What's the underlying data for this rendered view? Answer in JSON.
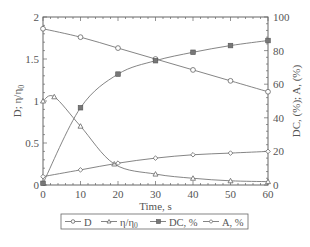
{
  "chart_data": {
    "type": "line",
    "title": "",
    "xlabel": "Time, s",
    "ylabel_left": "D; η/η0",
    "ylabel_right": "DC, (%); A, (%)",
    "xlim": [
      0,
      60
    ],
    "ylim_left": [
      0,
      2
    ],
    "ylim_right": [
      0,
      100
    ],
    "x_ticks": [
      0,
      10,
      20,
      30,
      40,
      50,
      60
    ],
    "y_ticks_left": [
      0,
      0.5,
      1,
      1.5,
      2
    ],
    "y_ticks_left_labels": [
      "0",
      "0.5",
      "1",
      "1.5",
      "2"
    ],
    "y_ticks_right": [
      0,
      20,
      40,
      60,
      80,
      100
    ],
    "grid": false,
    "legend_position": "bottom",
    "series": [
      {
        "name": "D",
        "axis": "left",
        "marker": "circle-open",
        "x": [
          0,
          10,
          20,
          30,
          40,
          50,
          60
        ],
        "values": [
          1.86,
          1.76,
          1.63,
          1.5,
          1.37,
          1.24,
          1.11
        ]
      },
      {
        "name": "η/η0",
        "axis": "left",
        "marker": "triangle-open",
        "x": [
          0,
          3,
          10,
          19,
          30,
          40,
          50,
          60
        ],
        "values": [
          1.0,
          1.05,
          0.7,
          0.25,
          0.13,
          0.08,
          0.05,
          0.04
        ]
      },
      {
        "name": "DC, %",
        "axis": "right",
        "marker": "square-filled",
        "x": [
          0,
          10,
          20,
          30,
          40,
          50,
          60
        ],
        "values": [
          1,
          46,
          66,
          74,
          79,
          83,
          86
        ]
      },
      {
        "name": "A, %",
        "axis": "right",
        "marker": "diamond-open",
        "x": [
          0,
          10,
          20,
          30,
          40,
          50,
          60
        ],
        "values": [
          5,
          9,
          13,
          16,
          18,
          19,
          20
        ]
      }
    ]
  },
  "labels": {
    "xlabel": "Time, s",
    "ylabel_left_main": "D; η/η",
    "ylabel_left_sub": "0",
    "ylabel_right": "DC, (%); A, (%)",
    "x_ticks": [
      "0",
      "10",
      "20",
      "30",
      "40",
      "50",
      "60"
    ],
    "y_left": [
      "0",
      "0.5",
      "1",
      "1.5",
      "2"
    ],
    "y_right": [
      "0",
      "20",
      "40",
      "60",
      "80",
      "100"
    ]
  },
  "legend": {
    "items": [
      {
        "label": "D"
      },
      {
        "label_main": "η/η",
        "label_sub": "0"
      },
      {
        "label": "DC, %"
      },
      {
        "label": "A, %"
      }
    ]
  }
}
